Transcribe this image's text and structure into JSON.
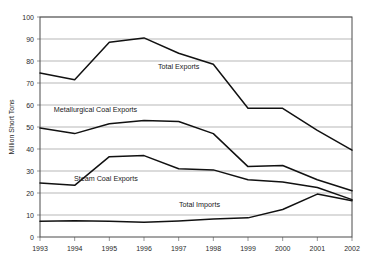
{
  "chart_data": {
    "type": "line",
    "title": "",
    "subtitle": "",
    "xlabel": "",
    "ylabel": "Million Short Tons",
    "x": [
      1993,
      1994,
      1995,
      1996,
      1997,
      1998,
      1999,
      2000,
      2001,
      2002
    ],
    "xticklabels": [
      "1993",
      "1994",
      "1995",
      "1996",
      "1997",
      "1998",
      "1999",
      "2000",
      "2001",
      "2002"
    ],
    "yticklabels": [
      "0",
      "10",
      "20",
      "30",
      "40",
      "50",
      "60",
      "70",
      "80",
      "90",
      "100"
    ],
    "yticks": [
      0,
      10,
      20,
      30,
      40,
      50,
      60,
      70,
      80,
      90,
      100
    ],
    "ylim": [
      0,
      100
    ],
    "xlim": [
      1993,
      2002
    ],
    "grid": "horizontal",
    "legend": "inline-annotations",
    "series": [
      {
        "name": "Total Exports",
        "values": [
          74.5,
          71.5,
          88.5,
          90.5,
          83.5,
          78.5,
          58.5,
          58.5,
          48.5,
          39.5
        ],
        "label_x": 1997.0,
        "label_y": 76.5
      },
      {
        "name": "Metallurgical Coal Exports",
        "values": [
          49.5,
          47.0,
          51.5,
          53.0,
          52.5,
          47.0,
          32.0,
          32.5,
          26.0,
          21.0
        ],
        "label_x": 1994.6,
        "label_y": 57.0
      },
      {
        "name": "Steam Coal Exports",
        "values": [
          24.5,
          23.5,
          36.5,
          37.0,
          31.0,
          30.5,
          26.0,
          25.0,
          22.5,
          17.0
        ],
        "label_x": 1994.9,
        "label_y": 25.5
      },
      {
        "name": "Total Imports",
        "values": [
          7.2,
          7.4,
          7.2,
          6.7,
          7.3,
          8.2,
          8.7,
          12.5,
          19.5,
          16.5
        ],
        "label_x": 1997.6,
        "label_y": 13.8
      }
    ],
    "colors": {
      "line": "#111111",
      "grid": "#9a9a9a",
      "frame": "#4a4a4a",
      "text": "#2a2a2a",
      "background": "#ffffff"
    }
  }
}
